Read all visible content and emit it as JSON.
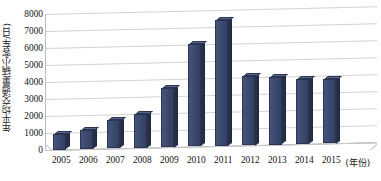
{
  "chart_data": {
    "type": "bar",
    "title": "",
    "subtitle": "",
    "xlabel": "(年份)",
    "ylabel": "年平均交通量(辆小客车/日)",
    "categories": [
      "2005",
      "2006",
      "2007",
      "2008",
      "2009",
      "2010",
      "2011",
      "2012",
      "2013",
      "2014",
      "2015"
    ],
    "values": [
      900,
      1100,
      1650,
      2000,
      3500,
      6000,
      7400,
      4100,
      3950,
      3800,
      3800
    ],
    "ylim": [
      0,
      8000
    ],
    "ytick_labels": [
      "0",
      "1000",
      "2000",
      "3000",
      "4000",
      "5000",
      "6000",
      "7000",
      "8000"
    ],
    "ytick_values": [
      0,
      1000,
      2000,
      3000,
      4000,
      5000,
      6000,
      7000,
      8000
    ],
    "grid": true,
    "legend": false,
    "legend_position": "none",
    "series": [
      {
        "name": "年平均交通量",
        "values": [
          900,
          1100,
          1650,
          2000,
          3500,
          6000,
          7400,
          4100,
          3950,
          3800,
          3800
        ]
      }
    ],
    "style": {
      "bar_color": "#3c4a70",
      "bar_side_color": "#262f49",
      "bar_top_color": "#59658c",
      "bar_outline_color": "#2b3450",
      "grid_color": "#d2d2d2",
      "axis_color": "#9a9a9a",
      "background": "#ffffff",
      "text_color": "#111111",
      "three_d": true
    }
  }
}
